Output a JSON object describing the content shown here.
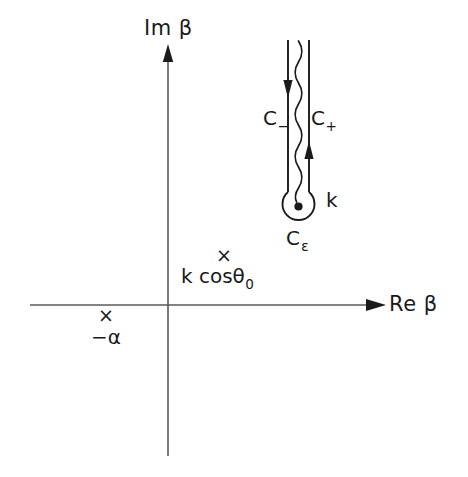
{
  "figure": {
    "kind": "complex-plane-contour-diagram",
    "background_color": "#ffffff",
    "ink_color": "#1a1a1a",
    "axes": {
      "imaginary_axis_label": "Im β",
      "real_axis_label": "Re β",
      "origin_px": {
        "x": 168,
        "y": 305
      },
      "vertical_axis_x": 168,
      "vertical_axis_top_y": 46,
      "vertical_axis_bottom_y": 456,
      "horizontal_axis_y": 305,
      "horizontal_axis_left_x": 30,
      "horizontal_axis_right_x": 386
    },
    "contour": {
      "left_branch_label": "C",
      "left_branch_subscript": "−",
      "right_branch_label": "C",
      "right_branch_subscript": "+",
      "small_circle_label": "C",
      "small_circle_subscript": "ε",
      "branch_point_label": "k",
      "left_line_x": 288,
      "right_line_x": 309,
      "line_top_y": 40,
      "circle_center": {
        "x": 298,
        "y": 207
      },
      "circle_radius": 16,
      "left_arrow_y": 88,
      "right_arrow_y": 152,
      "branch_cut_style": "wavy"
    },
    "poles": [
      {
        "marker": "×",
        "label": "k cosθ",
        "label_subscript": "0",
        "marker_px": {
          "x": 222,
          "y": 255
        },
        "label_px": {
          "x": 181,
          "y": 266
        }
      },
      {
        "marker": "×",
        "label": "−α",
        "label_subscript": "",
        "marker_px": {
          "x": 105,
          "y": 315
        },
        "label_px": {
          "x": 91,
          "y": 327
        }
      }
    ]
  }
}
